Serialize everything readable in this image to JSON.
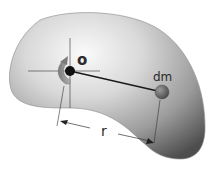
{
  "diagram": {
    "type": "rigid-body moment of inertia illustration",
    "labels": {
      "pivot": "o",
      "mass_element": "dm",
      "distance": "r"
    },
    "colors": {
      "body_light": "#f2f2f2",
      "body_mid": "#b8b8b8",
      "body_dark": "#5a5a5a",
      "pivot_dot": "#111111",
      "mass_ball": "#6e6e6e",
      "rotation_arrow": "#8a8a8a",
      "lines": "#222222"
    }
  }
}
